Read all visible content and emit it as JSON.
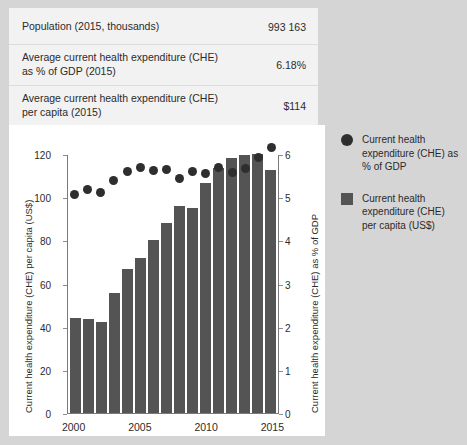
{
  "summary": {
    "rows": [
      {
        "label": "Population (2015, thousands)",
        "value": "993 163"
      },
      {
        "label": "Average current health expenditure (CHE) as % of GDP (2015)",
        "value": "6.18%"
      },
      {
        "label": "Average current health expenditure (CHE) per capita (2015)",
        "value": "$114"
      },
      {
        "label": "Average GDP per capita (2015)",
        "value": "$2 200"
      }
    ]
  },
  "legend": {
    "items": [
      {
        "marker": "circle-marker",
        "label": "Current health expenditure (CHE) as % of GDP",
        "color": "#2e2e2e"
      },
      {
        "marker": "square-marker",
        "label": "Current health expenditure (CHE) per capita (US$)",
        "color": "#545454"
      }
    ]
  },
  "chart_data": {
    "type": "bar",
    "title": "",
    "xlabel": "",
    "ylabel": "Current health expenditure (CHE) per capita (US$)",
    "y2label": "Current health expenditure (CHE) as % of GDP",
    "grid": false,
    "legend_position": "right",
    "categories": [
      2000,
      2001,
      2002,
      2003,
      2004,
      2005,
      2006,
      2007,
      2008,
      2009,
      2010,
      2011,
      2012,
      2013,
      2014,
      2015
    ],
    "xticks": [
      "2000",
      "2005",
      "2010",
      "2015"
    ],
    "ylim": [
      0,
      120
    ],
    "yticks": [
      0,
      20,
      40,
      60,
      80,
      100,
      120
    ],
    "y2lim": [
      0,
      6
    ],
    "y2ticks": [
      0,
      1,
      2,
      3,
      4,
      5,
      6
    ],
    "series": [
      {
        "name": "Current health expenditure (CHE) per capita (US$)",
        "type": "bar",
        "axis": "left",
        "color": "#545454",
        "values": [
          44,
          43.5,
          42.5,
          56,
          67,
          72,
          80.5,
          88.5,
          96.5,
          95.5,
          107,
          114,
          118.5,
          120,
          120.5,
          113
        ]
      },
      {
        "name": "Current health expenditure (CHE) as % of GDP",
        "type": "scatter",
        "axis": "right",
        "color": "#2e2e2e",
        "values": [
          5.07,
          5.2,
          5.12,
          5.4,
          5.62,
          5.7,
          5.65,
          5.67,
          5.45,
          5.62,
          5.58,
          5.72,
          5.6,
          5.68,
          5.95,
          6.18
        ]
      }
    ]
  }
}
